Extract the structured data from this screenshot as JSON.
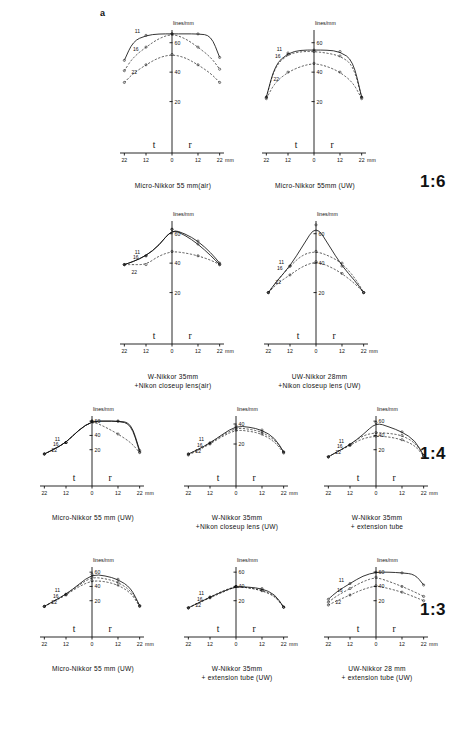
{
  "figure": {
    "panel_label": "a",
    "axis_y_title": "lines/mm",
    "axis_x_unit": "mm",
    "field_labels": {
      "tangential": "t",
      "radial": "r"
    },
    "x_ticks": [
      "22",
      "12",
      "0",
      "12",
      "22"
    ],
    "y_ticks": [
      "20",
      "40",
      "60"
    ],
    "aperture_labels": [
      "11",
      "16",
      "22"
    ]
  },
  "chart_data": [
    {
      "id": "r1c1",
      "type": "line",
      "title": "Micro-Nikkor 55 mm(air)",
      "title_lines": [
        "Micro-Nikkor 55 mm(air)"
      ],
      "magnification": "1:6",
      "xlabel": "mm",
      "ylabel": "lines/mm",
      "xlim": [
        -26,
        26
      ],
      "ylim": [
        0,
        70
      ],
      "yticks": [
        20,
        40,
        60
      ],
      "xticks": [
        -22,
        -12,
        0,
        12,
        22
      ],
      "x": [
        -22,
        -18,
        -12,
        -6,
        0,
        6,
        12,
        18,
        22
      ],
      "series": [
        {
          "name": "11",
          "style": "solid",
          "values": [
            48,
            61,
            65,
            66,
            66,
            66,
            66,
            65,
            50
          ]
        },
        {
          "name": "16",
          "style": "dashed",
          "values": [
            41,
            50,
            57,
            63,
            66,
            63,
            57,
            50,
            42
          ]
        },
        {
          "name": "22",
          "style": "dashed",
          "values": [
            33,
            39,
            45,
            50,
            52,
            50,
            45,
            39,
            33
          ]
        }
      ]
    },
    {
      "id": "r1c2",
      "type": "line",
      "title": "Micro-Nikkor 55mm (UW)",
      "title_lines": [
        "Micro-Nikkor 55mm (UW)"
      ],
      "magnification": "1:6",
      "xlabel": "mm",
      "ylabel": "lines/mm",
      "xlim": [
        -26,
        26
      ],
      "ylim": [
        0,
        70
      ],
      "yticks": [
        20,
        40,
        60
      ],
      "xticks": [
        -22,
        -12,
        0,
        12,
        22
      ],
      "x": [
        -22,
        -18,
        -12,
        -6,
        0,
        6,
        12,
        18,
        22
      ],
      "series": [
        {
          "name": "11",
          "style": "solid",
          "values": [
            23,
            45,
            53,
            55,
            55,
            55,
            54,
            48,
            23
          ]
        },
        {
          "name": "16",
          "style": "dashed",
          "values": [
            23,
            44,
            52,
            54,
            54,
            53,
            51,
            45,
            23
          ]
        },
        {
          "name": "22",
          "style": "dashed",
          "values": [
            22,
            33,
            40,
            44,
            46,
            44,
            40,
            33,
            22
          ]
        }
      ]
    },
    {
      "id": "r2c1",
      "type": "line",
      "title": "W-Nikkor 35mm +Nikon closeup lens(air)",
      "title_lines": [
        "W-Nikkor 35mm",
        "+Nikon closeup lens(air)"
      ],
      "magnification": "1:6",
      "xlabel": "mm",
      "ylabel": "lines/mm",
      "xlim": [
        -26,
        26
      ],
      "ylim": [
        0,
        70
      ],
      "yticks": [
        20,
        40,
        60
      ],
      "xticks": [
        -22,
        -12,
        0,
        12,
        22
      ],
      "x": [
        -22,
        -18,
        -12,
        -6,
        0,
        6,
        12,
        18,
        22
      ],
      "series": [
        {
          "name": "11",
          "style": "solid",
          "values": [
            39,
            41,
            45,
            52,
            63,
            60,
            55,
            47,
            40
          ]
        },
        {
          "name": "16",
          "style": "solid",
          "values": [
            39,
            41,
            45,
            52,
            63,
            59,
            53,
            45,
            39
          ]
        },
        {
          "name": "22",
          "style": "dashed",
          "values": [
            39,
            39,
            39,
            45,
            48,
            47,
            45,
            42,
            39
          ]
        }
      ]
    },
    {
      "id": "r2c2",
      "type": "line",
      "title": "UW-Nikkor 28mm +Nikon closeup lens (UW)",
      "title_lines": [
        "UW-Nikkor 28mm",
        "+Nikon closeup lens (UW)"
      ],
      "magnification": "1:6",
      "xlabel": "mm",
      "ylabel": "lines/mm",
      "xlim": [
        -26,
        26
      ],
      "ylim": [
        0,
        70
      ],
      "yticks": [
        20,
        40,
        60
      ],
      "xticks": [
        -22,
        -12,
        0,
        12,
        22
      ],
      "x": [
        -22,
        -18,
        -12,
        -6,
        0,
        6,
        12,
        18,
        22
      ],
      "series": [
        {
          "name": "11",
          "style": "solid",
          "values": [
            20,
            28,
            38,
            52,
            66,
            52,
            38,
            28,
            20
          ]
        },
        {
          "name": "16",
          "style": "dashed",
          "values": [
            20,
            28,
            38,
            46,
            48,
            45,
            40,
            30,
            20
          ]
        },
        {
          "name": "22",
          "style": "dashed",
          "values": [
            20,
            26,
            32,
            38,
            41,
            38,
            33,
            26,
            20
          ]
        }
      ]
    },
    {
      "id": "r3c1",
      "type": "line",
      "title": "Micro-Nikkor 55 mm (UW)",
      "title_lines": [
        "Micro-Nikkor 55 mm (UW)"
      ],
      "magnification": "1:4",
      "xlabel": "mm",
      "ylabel": "lines/mm",
      "xlim": [
        -26,
        26
      ],
      "ylim": [
        0,
        70
      ],
      "yticks": [
        20,
        40,
        60
      ],
      "xticks": [
        -22,
        -12,
        0,
        12,
        22
      ],
      "x": [
        -22,
        -18,
        -12,
        -6,
        0,
        6,
        12,
        18,
        22
      ],
      "series": [
        {
          "name": "11",
          "style": "solid",
          "values": [
            14,
            20,
            30,
            48,
            60,
            60,
            60,
            58,
            19
          ]
        },
        {
          "name": "16",
          "style": "solid",
          "values": [
            14,
            20,
            30,
            48,
            60,
            60,
            60,
            56,
            17
          ]
        },
        {
          "name": "22",
          "style": "dashed",
          "values": [
            14,
            20,
            30,
            48,
            60,
            52,
            42,
            30,
            16
          ]
        }
      ]
    },
    {
      "id": "r3c2",
      "type": "line",
      "title": "W-Nikkor 35mm +Nikon closeup lens (UW)",
      "title_lines": [
        "W-Nikkor  35mm",
        "+Nikon closeup lens (UW)"
      ],
      "magnification": "1:4",
      "xlabel": "mm",
      "ylabel": "lines/mm",
      "xlim": [
        -26,
        26
      ],
      "ylim": [
        0,
        50
      ],
      "yticks": [
        20,
        40
      ],
      "xticks": [
        -22,
        -12,
        0,
        12,
        22
      ],
      "x": [
        -22,
        -18,
        -12,
        -6,
        0,
        6,
        12,
        18,
        22
      ],
      "series": [
        {
          "name": "11",
          "style": "solid",
          "values": [
            10,
            14,
            21,
            30,
            38,
            37,
            34,
            26,
            12
          ]
        },
        {
          "name": "16",
          "style": "dashed",
          "values": [
            10,
            14,
            21,
            29,
            36,
            35,
            32,
            24,
            12
          ]
        },
        {
          "name": "22",
          "style": "dashed",
          "values": [
            9,
            13,
            20,
            28,
            34,
            33,
            30,
            22,
            11
          ]
        }
      ]
    },
    {
      "id": "r3c3",
      "type": "line",
      "title": "W-Nikkor 35mm + extension tube",
      "title_lines": [
        "W-Nikkor 35mm",
        "+ extension  tube"
      ],
      "magnification": "1:4",
      "xlabel": "mm",
      "ylabel": "lines/mm",
      "xlim": [
        -26,
        26
      ],
      "ylim": [
        0,
        70
      ],
      "yticks": [
        20,
        40,
        60
      ],
      "xticks": [
        -22,
        -12,
        0,
        12,
        22
      ],
      "x": [
        -22,
        -18,
        -12,
        -6,
        0,
        6,
        12,
        18,
        22
      ],
      "series": [
        {
          "name": "11",
          "style": "solid",
          "values": [
            10,
            17,
            27,
            41,
            58,
            52,
            45,
            33,
            12
          ]
        },
        {
          "name": "16",
          "style": "dashed",
          "values": [
            10,
            17,
            27,
            40,
            44,
            43,
            40,
            30,
            12
          ]
        },
        {
          "name": "22",
          "style": "dashed",
          "values": [
            10,
            17,
            26,
            36,
            39,
            38,
            34,
            26,
            11
          ]
        }
      ]
    },
    {
      "id": "r4c1",
      "type": "line",
      "title": "Micro-Nikkor 55 mm (UW)",
      "title_lines": [
        "Micro-Nikkor 55 mm (UW)"
      ],
      "magnification": "1:3",
      "xlabel": "mm",
      "ylabel": "lines/mm",
      "xlim": [
        -26,
        26
      ],
      "ylim": [
        0,
        70
      ],
      "yticks": [
        20,
        40,
        60
      ],
      "xticks": [
        -22,
        -12,
        0,
        12,
        22
      ],
      "x": [
        -22,
        -18,
        -12,
        -6,
        0,
        6,
        12,
        18,
        22
      ],
      "series": [
        {
          "name": "11",
          "style": "solid",
          "values": [
            12,
            19,
            29,
            43,
            57,
            55,
            50,
            38,
            13
          ]
        },
        {
          "name": "16",
          "style": "dashed",
          "values": [
            12,
            19,
            29,
            42,
            53,
            51,
            46,
            34,
            13
          ]
        },
        {
          "name": "22",
          "style": "dashed",
          "values": [
            12,
            18,
            28,
            40,
            48,
            47,
            42,
            31,
            12
          ]
        }
      ]
    },
    {
      "id": "r4c2",
      "type": "line",
      "title": "W-Nikkor 35mm + extension tube(UW)",
      "title_lines": [
        "W-Nikkor  35mm",
        "+ extension  tube (UW)"
      ],
      "magnification": "1:3",
      "xlabel": "mm",
      "ylabel": "lines/mm",
      "xlim": [
        -26,
        26
      ],
      "ylim": [
        0,
        70
      ],
      "yticks": [
        20,
        40,
        60
      ],
      "xticks": [
        -22,
        -12,
        0,
        12,
        22
      ],
      "x": [
        -22,
        -18,
        -12,
        -6,
        0,
        6,
        12,
        18,
        22
      ],
      "series": [
        {
          "name": "11",
          "style": "solid",
          "values": [
            10,
            16,
            25,
            33,
            40,
            39,
            37,
            29,
            11
          ]
        },
        {
          "name": "16",
          "style": "dashed",
          "values": [
            10,
            16,
            25,
            34,
            40,
            38,
            35,
            27,
            11
          ]
        },
        {
          "name": "22",
          "style": "dashed",
          "values": [
            10,
            16,
            24,
            32,
            40,
            38,
            34,
            26,
            11
          ]
        }
      ]
    },
    {
      "id": "r4c3",
      "type": "line",
      "title": "UW-Nikkor 28 mm + extension tube (UW)",
      "title_lines": [
        "UW-Nikkor  28 mm",
        "+ extension tube (UW)"
      ],
      "magnification": "1:3",
      "xlabel": "mm",
      "ylabel": "lines/mm",
      "xlim": [
        -26,
        26
      ],
      "ylim": [
        0,
        70
      ],
      "yticks": [
        20,
        40,
        60
      ],
      "xticks": [
        -22,
        -12,
        0,
        12,
        22
      ],
      "x": [
        -22,
        -18,
        -12,
        -6,
        0,
        6,
        12,
        18,
        22
      ],
      "series": [
        {
          "name": "11",
          "style": "solid",
          "values": [
            22,
            33,
            44,
            55,
            60,
            60,
            59,
            57,
            42
          ]
        },
        {
          "name": "16",
          "style": "dashed",
          "values": [
            18,
            27,
            37,
            47,
            53,
            47,
            40,
            32,
            26
          ]
        },
        {
          "name": "22",
          "style": "dashed",
          "values": [
            14,
            20,
            28,
            36,
            41,
            37,
            32,
            25,
            20
          ]
        }
      ]
    }
  ],
  "ratios": [
    {
      "id": "ratio-1-6",
      "label": "1:6"
    },
    {
      "id": "ratio-1-4",
      "label": "1:4"
    },
    {
      "id": "ratio-1-3",
      "label": "1:3"
    }
  ]
}
